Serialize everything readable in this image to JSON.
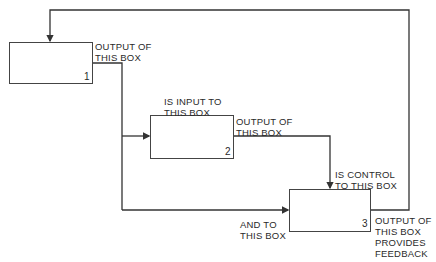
{
  "diagram": {
    "type": "IDEF0 box interconnection",
    "colors": {
      "line": "#333333",
      "text": "#2a2a2a",
      "background": "#ffffff"
    },
    "boxes": [
      {
        "id": "1",
        "number": "1"
      },
      {
        "id": "2",
        "number": "2"
      },
      {
        "id": "3",
        "number": "3"
      }
    ],
    "labels": {
      "box1_output": "OUTPUT OF\nTHIS BOX",
      "box2_input": "IS INPUT TO\nTHIS BOX",
      "box2_output": "OUTPUT OF\nTHIS BOX",
      "box3_control": "IS CONTROL\nTO THIS BOX",
      "box3_input": "AND TO\nTHIS BOX",
      "box3_output": "OUTPUT OF\nTHIS BOX\nPROVIDES\nFEEDBACK"
    },
    "connections": [
      {
        "from": "1",
        "to": "2",
        "role": "input"
      },
      {
        "from": "1",
        "to": "3",
        "role": "input"
      },
      {
        "from": "2",
        "to": "3",
        "role": "control"
      },
      {
        "from": "3",
        "to": "1",
        "role": "feedback"
      }
    ]
  }
}
